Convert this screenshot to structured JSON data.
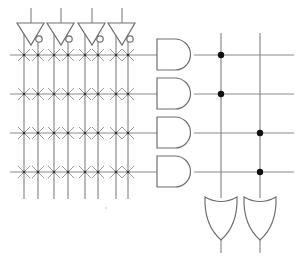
{
  "diagram": {
    "type": "PLA (programmable logic array) schematic",
    "colors": {
      "wire": "#8a8a8a",
      "gate_outline": "#6e6e6e",
      "connection_dot": "#111111",
      "background": "#ffffff"
    },
    "input_buffers": [
      {
        "id": "buffer-1",
        "input_x": 31,
        "true_line_x": 24,
        "complement_line_x": 38
      },
      {
        "id": "buffer-2",
        "input_x": 61,
        "true_line_x": 54,
        "complement_line_x": 68
      },
      {
        "id": "buffer-3",
        "input_x": 92,
        "true_line_x": 85,
        "complement_line_x": 98
      },
      {
        "id": "buffer-4",
        "input_x": 122,
        "true_line_x": 116,
        "complement_line_x": 128
      }
    ],
    "product_rows_y": [
      55,
      94,
      133,
      172
    ],
    "and_gates": [
      {
        "id": "and-gate-1",
        "row": 0
      },
      {
        "id": "and-gate-2",
        "row": 1
      },
      {
        "id": "and-gate-3",
        "row": 2
      },
      {
        "id": "and-gate-4",
        "row": 3
      }
    ],
    "or_columns_x": [
      221,
      260
    ],
    "or_gates": [
      {
        "id": "or-gate-1",
        "column": 0
      },
      {
        "id": "or-gate-2",
        "column": 1
      }
    ],
    "or_connections": [
      {
        "row": 0,
        "column": 0
      },
      {
        "row": 1,
        "column": 0
      },
      {
        "row": 2,
        "column": 1
      },
      {
        "row": 3,
        "column": 1
      }
    ],
    "and_array_fuses": "all intersections programmable (X marks)"
  }
}
